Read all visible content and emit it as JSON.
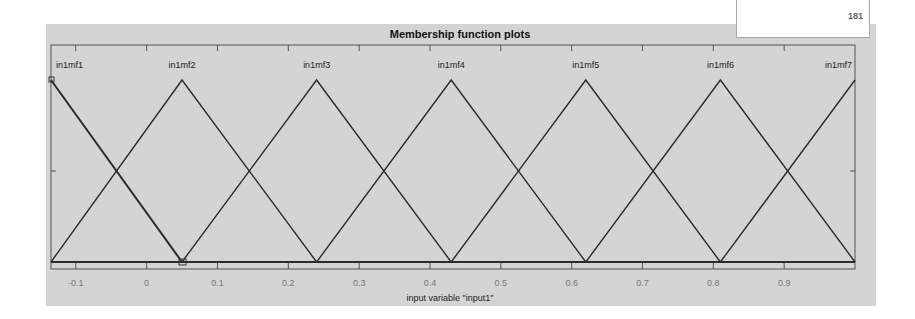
{
  "window": {
    "title": "Membership function plots",
    "corner_box_text": "181"
  },
  "plot": {
    "xlabel": "input variable \"input1\"",
    "x_ticks": [
      "-0.1",
      "0",
      "0.1",
      "0.2",
      "0.3",
      "0.4",
      "0.5",
      "0.6",
      "0.7",
      "0.8",
      "0.9"
    ],
    "mf_labels": [
      "in1mf1",
      "in1mf2",
      "in1mf3",
      "in1mf4",
      "in1mf5",
      "in1mf6",
      "in1mf7"
    ],
    "line_color": "#2b2b2b",
    "background_color": "#d4d4d4"
  },
  "chart_data": {
    "type": "line",
    "title": "Membership function plots",
    "xlabel": "input variable \"input1\"",
    "ylabel": "",
    "xlim": [
      -0.135,
      1.0
    ],
    "ylim": [
      0,
      1
    ],
    "grid": false,
    "series": [
      {
        "name": "in1mf1",
        "shape": "trimf",
        "x": [
          -0.135,
          0.05
        ],
        "y": [
          1,
          0
        ]
      },
      {
        "name": "in1mf2",
        "shape": "trimf",
        "x": [
          -0.135,
          0.05,
          0.24
        ],
        "y": [
          0,
          1,
          0
        ]
      },
      {
        "name": "in1mf3",
        "shape": "trimf",
        "x": [
          0.05,
          0.24,
          0.43
        ],
        "y": [
          0,
          1,
          0
        ]
      },
      {
        "name": "in1mf4",
        "shape": "trimf",
        "x": [
          0.24,
          0.43,
          0.62
        ],
        "y": [
          0,
          1,
          0
        ]
      },
      {
        "name": "in1mf5",
        "shape": "trimf",
        "x": [
          0.43,
          0.62,
          0.81
        ],
        "y": [
          0,
          1,
          0
        ]
      },
      {
        "name": "in1mf6",
        "shape": "trimf",
        "x": [
          0.62,
          0.81,
          1.0
        ],
        "y": [
          0,
          1,
          0
        ]
      },
      {
        "name": "in1mf7",
        "shape": "trimf",
        "x": [
          0.81,
          1.0
        ],
        "y": [
          0,
          1
        ]
      }
    ],
    "selected_mf": "in1mf1"
  }
}
